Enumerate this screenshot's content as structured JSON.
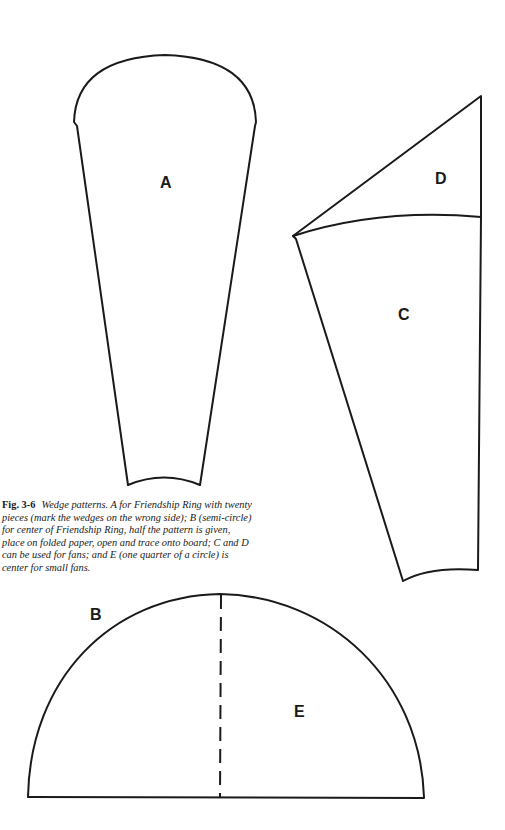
{
  "figure": {
    "number": "Fig. 3-6",
    "caption": "Wedge patterns. A for Friendship Ring with twenty pieces (mark the wedges on the wrong side); B (semi-circle) for center of Friendship Ring, half the pattern is given, place on folded paper, open and trace onto board; C and D can be used for fans; and E (one quarter of a circle) is center for small fans."
  },
  "patterns": {
    "a": {
      "label": "A",
      "description": "Wedge for Friendship Ring"
    },
    "b": {
      "label": "B",
      "description": "Semi-circle for center of Friendship Ring"
    },
    "c": {
      "label": "C",
      "description": "Fan wedge"
    },
    "d": {
      "label": "D",
      "description": "Fan wedge"
    },
    "e": {
      "label": "E",
      "description": "Quarter circle center for small fans"
    }
  },
  "colors": {
    "ink": "#1a1a1a",
    "paper": "#ffffff"
  }
}
